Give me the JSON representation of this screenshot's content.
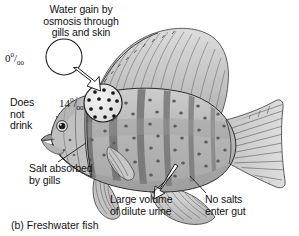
{
  "figure": {
    "caption": "(b) Freshwater fish",
    "caption_part": "(b)",
    "background_color": "#ffffff",
    "ink_color": "#141414"
  },
  "labels": {
    "water_gain": "Water gain by osmosis through gills and skin",
    "water_gain_line1": "Water gain by",
    "water_gain_line2": "osmosis through",
    "water_gain_line3": "gills and skin",
    "does_not_drink": "Does not drink",
    "does_not_drink_line1": "Does",
    "does_not_drink_line2": "not",
    "does_not_drink_line3": "drink",
    "salt_absorbed": "Salt absorbed by gills",
    "salt_absorbed_line1": "Salt absorbed",
    "salt_absorbed_line2": "by gills",
    "urine": "Large volume of dilute urine",
    "urine_line1": "Large volume",
    "urine_line2": "of dilute urine",
    "no_salts": "No salts enter gut",
    "no_salts_line1": "No salts",
    "no_salts_line2": "enter gut"
  },
  "salinity": {
    "environment_value": "0",
    "environment_unit": "0/00",
    "environment_full": "0 0/00",
    "body_value": "14",
    "body_unit": "0/00",
    "body_full": "14 0/00",
    "unit_name": "per mille (parts per thousand)"
  },
  "callouts": {
    "environment_circle_name": "environment-water-circle",
    "body_circle_name": "body-fluid-detail-circle",
    "body_circle_dot_count": 13,
    "environment_circle_dot_count": 0
  },
  "arrows": {
    "water_in": "hollow arrow: water enters fish",
    "urine_out": "hollow arrow: dilute urine leaves fish",
    "salt_pointer": "leader line to gill",
    "no_salts_pointer": "leader line to gut"
  },
  "fish": {
    "species_look": "cichlid",
    "body_fill": "#b9b9b9",
    "stripe_fill": "#6e6e6e",
    "fin_fill": "#cfcfcf",
    "outline": "#2b2b2b",
    "stripe_count": 6,
    "orientation": "facing left"
  }
}
